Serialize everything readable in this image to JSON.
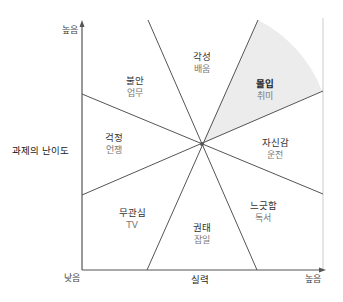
{
  "axes": {
    "y": {
      "title": "과제의 난이도",
      "high_label": "높음",
      "low_label": "낮음"
    },
    "x": {
      "title": "실력",
      "high_label": "높음"
    }
  },
  "zones": [
    {
      "id": "arousal",
      "state": "각성",
      "activity": "배움"
    },
    {
      "id": "flow",
      "state": "몰입",
      "activity": "취미",
      "highlighted": true
    },
    {
      "id": "anxiety",
      "state": "불안",
      "activity": "업무"
    },
    {
      "id": "worry",
      "state": "걱정",
      "activity": "언쟁"
    },
    {
      "id": "control",
      "state": "자신감",
      "activity": "운전"
    },
    {
      "id": "apathy",
      "state": "무관심",
      "activity": "TV"
    },
    {
      "id": "boredom",
      "state": "권태",
      "activity": "잡일"
    },
    {
      "id": "relaxation",
      "state": "느긋함",
      "activity": "독서"
    }
  ],
  "colors": {
    "line": "#555555",
    "axis": "#555555",
    "border": "#cccccc",
    "flow_fill": "#ececec"
  }
}
